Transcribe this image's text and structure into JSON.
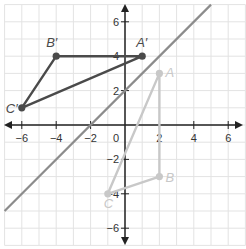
{
  "chart_data": {
    "type": "scatter",
    "title": "",
    "xlabel": "",
    "ylabel": "",
    "xlim": [
      -7,
      7
    ],
    "ylim": [
      -7,
      7
    ],
    "grid": true,
    "x_ticks": [
      -6,
      -4,
      -2,
      2,
      4,
      6
    ],
    "y_ticks": [
      6,
      4,
      2,
      -2,
      -4,
      -6
    ],
    "origin_label": "0",
    "reflection_line": {
      "equation": "y = x + 2",
      "slope": 1,
      "intercept": 2,
      "color": "#8c8c8c"
    },
    "series": [
      {
        "name": "Image triangle A'B'C'",
        "color": "#4a4a4a",
        "points": [
          {
            "label": "A′",
            "x": 1,
            "y": 4
          },
          {
            "label": "B′",
            "x": -4,
            "y": 4
          },
          {
            "label": "C′",
            "x": -6,
            "y": 1
          }
        ]
      },
      {
        "name": "Pre-image triangle ABC",
        "color": "#c8c8c8",
        "points": [
          {
            "label": "A",
            "x": 2,
            "y": 3
          },
          {
            "label": "B",
            "x": 2,
            "y": -3
          },
          {
            "label": "C",
            "x": -1,
            "y": -4
          }
        ]
      }
    ]
  },
  "colors": {
    "grid": "#e3e3e3",
    "axis": "#222222",
    "line": "#8c8c8c",
    "image": "#4a4a4a",
    "preimage": "#c8c8c8"
  }
}
